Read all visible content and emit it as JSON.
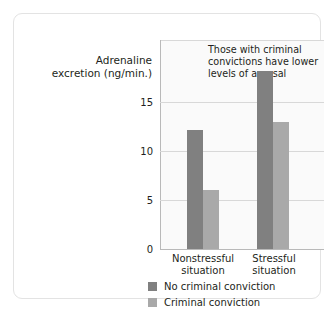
{
  "chart_data": {
    "type": "bar",
    "title": "",
    "xlabel": "",
    "ylabel": "Adrenaline excretion (ng/min.)",
    "ylabel_lines": [
      "Adrenaline",
      "excretion (ng/min.)"
    ],
    "categories": [
      "Nonstressful situation",
      "Stressful situation"
    ],
    "category_lines": [
      [
        "Nonstressful",
        "situation"
      ],
      [
        "Stressful",
        "situation"
      ]
    ],
    "series": [
      {
        "name": "No criminal conviction",
        "values": [
          10,
          15
        ],
        "color": "#808080"
      },
      {
        "name": "Criminal conviction",
        "values": [
          5,
          10.7
        ],
        "color": "#a9a9a9"
      }
    ],
    "ylim": [
      0,
      17.6
    ],
    "yticks": [
      0,
      5,
      10,
      15
    ],
    "ytick_labels": [
      "0",
      "5",
      "10",
      "15"
    ],
    "grid": true,
    "legend_position": "bottom",
    "annotations": [
      {
        "text": "Those with criminal convictions have lower levels of arousal",
        "lines": [
          "Those with criminal",
          "convictions have lower",
          "levels of arousal"
        ]
      }
    ]
  },
  "style": {
    "plot_background": "#fafafa",
    "card_background": "#ffffff",
    "grid_color": "#d8d8d8",
    "axis_color": "#b9b9b9",
    "text_color": "#231f20"
  }
}
